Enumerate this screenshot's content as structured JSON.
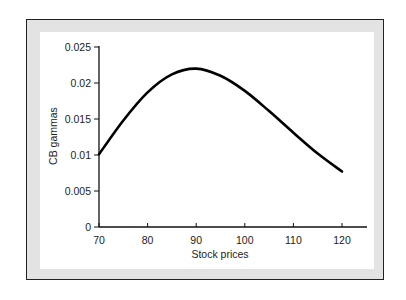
{
  "chart_data": {
    "type": "line",
    "title": "",
    "xlabel": "Stock prices",
    "ylabel": "CB gammas",
    "xlim": [
      70,
      125
    ],
    "ylim": [
      0,
      0.025
    ],
    "grid": false,
    "legend": null,
    "x_ticks": [
      "70",
      "80",
      "90",
      "100",
      "110",
      "120"
    ],
    "y_ticks": [
      "0",
      "0.005",
      "0.01",
      "0.015",
      "0.02",
      "0.025"
    ],
    "series": [
      {
        "name": "CB gammas",
        "x": [
          70,
          75,
          80,
          85,
          90,
          95,
          100,
          105,
          110,
          115,
          120
        ],
        "y": [
          0.0101,
          0.0148,
          0.0187,
          0.0212,
          0.022,
          0.021,
          0.0189,
          0.0161,
          0.0131,
          0.0102,
          0.0077
        ]
      }
    ]
  }
}
